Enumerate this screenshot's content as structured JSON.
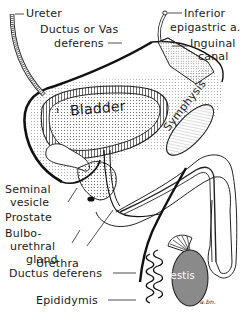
{
  "colors": {
    "line": "#1a1a1a",
    "paper": "#ffffff",
    "stipple": "#9a9a9a",
    "testis_fill": "#8a8a8a"
  },
  "labels": {
    "ureter": "Ureter",
    "ductus_or_vas_1": "Ductus or Vas",
    "ductus_or_vas_2": "deferens",
    "inferior_epigastric_1": "Inferior",
    "inferior_epigastric_2": "epigastric a.",
    "inguinal_1": "Inguinal",
    "inguinal_2": "canal",
    "bladder": "Bladder",
    "symphysis": "Symphysis",
    "seminal_1": "Seminal",
    "seminal_2": "vesicle",
    "prostate": "Prostate",
    "bulbo_1": "Bulbo-",
    "bulbo_2": "urethral",
    "bulbo_3": "gland",
    "urethra": "Urethra",
    "ductus_deferens": "Ductus deferens",
    "testis": "Testis",
    "epididymis": "Epididymis",
    "signature": "a.bn."
  }
}
